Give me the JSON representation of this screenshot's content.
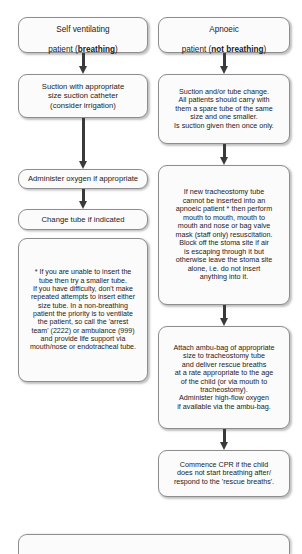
{
  "diagram": {
    "colors": {
      "box_border": "#8d8d8d",
      "box_fill": "#fbfbfb",
      "arrow": "#3a3a3a",
      "text": "#1c1c1c",
      "background": "#ffffff"
    },
    "columns": {
      "left": {
        "label": "Self ventilating (breathing) pathway"
      },
      "right": {
        "label": "Apnoeic (not breathing) pathway"
      }
    }
  },
  "left_column": {
    "nodes": [
      {
        "id": "self-ventilating-patient",
        "line1": "Self ventilating",
        "line2_prefix": "patient (",
        "line2_bold": "breathing",
        "line2_suffix": ")"
      },
      {
        "id": "suction-appropriate-catheter",
        "text": "Suction with appropriate\nsize suction catheter\n(consider irrigation)"
      },
      {
        "id": "administer-oxygen",
        "text": "Administer oxygen if appropriate"
      },
      {
        "id": "change-tube",
        "text": "Change tube if indicated"
      },
      {
        "id": "footnote-note",
        "text": "* If you are unable to insert the\ntube then try a smaller tube.\nIf you have difficulty, don't make\nrepeated attempts to insert either\nsize tube. In a non-breathing\npatient the priority is to ventilate\nthe patient, so call the 'arrest\nteam' (2222) or ambulance (999)\nand provide life support via\nmouth/nose or endotracheal tube."
      }
    ]
  },
  "right_column": {
    "nodes": [
      {
        "id": "apnoeic-patient",
        "line1": "Apnoeic",
        "line2_prefix": "patient (",
        "line2_bold": "not breathing",
        "line2_suffix": ")"
      },
      {
        "id": "suction-or-tube-change",
        "text": "Suction and/or tube change.\nAll patients should carry with\nthem a spare tube of the same\nsize and one smaller.\nIs suction given then once only."
      },
      {
        "id": "cannot-insert-tube-resuscitation",
        "text": "If new tracheostomy tube\ncannot be inserted into an\napnoeic patient * then perform\nmouth to mouth, mouth to\nmouth and nose or bag valve\nmask (staff only) resuscitation.\nBlock off the stoma site if air\nis escaping through it but\notherwise leave the stoma site\nalone, i.e. do not insert\nanything into it."
      },
      {
        "id": "attach-ambu-bag",
        "text": "Attach ambu-bag of appropriate\nsize to tracheostomy tube\nand deliver rescue breaths\nat a rate appropriate to the age\nof the child (or via mouth to\ntracheostomy).\nAdminister high-flow oxygen\nif available via the ambu-bag."
      },
      {
        "id": "commence-cpr",
        "text": "Commence CPR if the child\ndoes not start breathing after/\nrespond to the 'rescue breaths'."
      }
    ]
  },
  "bottom_banner": {
    "id": "bottom-cutoff-box",
    "text": ""
  }
}
